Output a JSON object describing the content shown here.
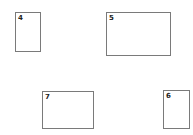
{
  "boxes": [
    {
      "id": "4",
      "label": "4"
    },
    {
      "id": "5",
      "label": "5"
    },
    {
      "id": "7",
      "label": "7"
    },
    {
      "id": "6",
      "label": "6"
    }
  ]
}
